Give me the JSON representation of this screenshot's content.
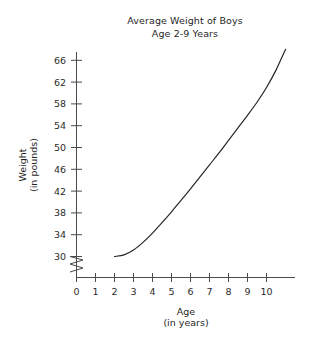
{
  "chart_data": {
    "type": "line",
    "title": "Average Weight of Boys",
    "subtitle": "Age 2-9 Years",
    "xlabel": "Age",
    "xlabel_units": "(in years)",
    "ylabel": "Weight",
    "ylabel_units": "(in pounds)",
    "xlim": [
      0,
      11.6
    ],
    "ylim": [
      28,
      71
    ],
    "xticks": [
      "0",
      "1",
      "2",
      "3",
      "4",
      "5",
      "6",
      "7",
      "8",
      "9",
      "10"
    ],
    "xtick_values": [
      0,
      1,
      2,
      3,
      4,
      5,
      6,
      7,
      8,
      9,
      10
    ],
    "yticks": [
      "30",
      "34",
      "38",
      "42",
      "46",
      "50",
      "54",
      "58",
      "62",
      "66",
      "70"
    ],
    "ytick_values": [
      30,
      34,
      38,
      42,
      46,
      50,
      54,
      58,
      62,
      66,
      70
    ],
    "grid": false,
    "legend": null,
    "y_axis_break": true,
    "y_axis_break_note": "zigzag break between 0 and 30",
    "series": [
      {
        "name": "Average Weight of Boys",
        "x": [
          2.0,
          2.5,
          3.0,
          3.5,
          4.0,
          4.5,
          5.0,
          5.5,
          6.0,
          6.5,
          7.0,
          7.5,
          8.0,
          8.5,
          9.0,
          9.5,
          10.0,
          10.5,
          11.0
        ],
        "values": [
          30.0,
          30.3,
          31.2,
          32.6,
          34.3,
          36.2,
          38.2,
          40.3,
          42.4,
          44.6,
          46.8,
          49.0,
          51.3,
          53.6,
          55.9,
          58.3,
          61.0,
          64.2,
          68.0
        ]
      }
    ]
  },
  "axis": {
    "x_title": "Age",
    "x_units": "(in years)",
    "y_title": "Weight",
    "y_units": "(in pounds)"
  }
}
